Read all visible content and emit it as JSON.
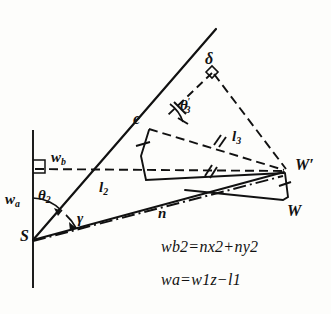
{
  "figure": {
    "kind": "geometric-vector-diagram",
    "background_color": "#fdfdfb",
    "ink_color": "#111111"
  },
  "points": {
    "S": "S",
    "e": "e",
    "delta": "δ",
    "W": "W",
    "W_prime": "W′"
  },
  "segments": {
    "l2": "l",
    "l2_sub": "2",
    "l3": "l",
    "l3_sub": "3",
    "n": "n",
    "wa": "w",
    "wa_sub": "a",
    "wb": "w",
    "wb_sub": "b"
  },
  "angles": {
    "theta2": "θ",
    "theta2_sub": "2",
    "theta3": "θ",
    "theta3_sub": "3",
    "theta3_prime": "′",
    "gamma": "γ"
  },
  "equations": {
    "eq1": {
      "lhs_sym": "w",
      "lhs_sub": "b",
      "lhs_sup": "2",
      "eq_op": "=",
      "t1_sym": "n",
      "t1_sub": "x",
      "t1_sup": "2",
      "plus_op": "+",
      "t2_sym": "n",
      "t2_sub": "y",
      "t2_sup": "2",
      "plain": "w_b^2 = n_x^2 + n_y^2"
    },
    "eq2": {
      "lhs_sym": "w",
      "lhs_sub": "a",
      "eq_op": "=",
      "t1_sym": "w",
      "t1_sub": "1z",
      "minus_op": "−",
      "t2_sym": "l",
      "t2_sub": "1",
      "plain": "w_a = w_1z - l_1"
    }
  },
  "marks": {
    "right_angle_at_axis": "right-angle-marker",
    "right_angle_at_delta": "right-angle-marker",
    "congruence_double_tick": "∥",
    "single_tick": "|"
  }
}
